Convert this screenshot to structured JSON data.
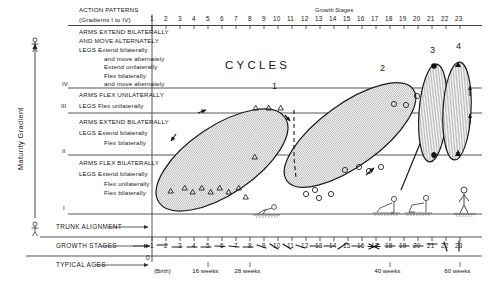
{
  "figure": {
    "title": "CYCLES",
    "y_axis_label": "Maturity Gradient",
    "x_axis_title": "Growth Stages",
    "column_header_line1": "ACTION PATTERNS",
    "column_header_line2": "(Gradients I to IV)",
    "origin_label": "0"
  },
  "gradients": [
    {
      "roman": "IV",
      "lines": [
        "ARMS EXTEND BILATERALLY",
        "AND MOVE ALTERNATELY",
        "LEGS Extend bilaterally",
        "and move alternately",
        "Extend unilaterally",
        "Flex bilaterally",
        "and move alternately"
      ]
    },
    {
      "roman": "III",
      "lines": [
        "ARMS FLEX UNILATERALLY",
        "LEGS Flex unilaterally"
      ]
    },
    {
      "roman": "II",
      "lines": [
        "ARMS EXTEND BILATERALLY",
        "LEGS Extend bilaterally",
        "Flex bilaterally"
      ]
    },
    {
      "roman": "I",
      "lines": [
        "ARMS FLEX BILATERALLY",
        "LEGS Extend bilaterally",
        "Flex unilaterally",
        "Flex bilaterally"
      ]
    }
  ],
  "bottom_rows": [
    {
      "label": "TRUNK ALIGNMENT"
    },
    {
      "label": "GROWTH STAGES"
    },
    {
      "label": "TYPICAL AGES"
    }
  ],
  "chart_data": {
    "type": "scatter",
    "title": "CYCLES",
    "xlabel": "Growth Stages",
    "ylabel": "Maturity Gradient",
    "xlim": [
      0,
      23.8
    ],
    "ylim": [
      0,
      4
    ],
    "grid": false,
    "legend": "none",
    "x_ticks": [
      1,
      2,
      3,
      4,
      5,
      6,
      7,
      8,
      9,
      10,
      11,
      12,
      13,
      14,
      15,
      16,
      17,
      18,
      19,
      20,
      21,
      22,
      23
    ],
    "x_tick_labels": [
      "1",
      "2",
      "3",
      "4",
      "5",
      "6",
      "7",
      "8",
      "9",
      "10",
      "11",
      "12",
      "13",
      "14",
      "15",
      "16",
      "17",
      "18",
      "19",
      "20",
      "21",
      "22",
      "23"
    ],
    "age_ticks": [
      {
        "stage": 1,
        "label": "(Birth)"
      },
      {
        "stage": 5,
        "label": "16 weeks"
      },
      {
        "stage": 8,
        "label": "28 weeks"
      },
      {
        "stage": 18,
        "label": "40 weeks"
      },
      {
        "stage": 23,
        "label": "60 weeks"
      }
    ],
    "gradient_bands": [
      "I",
      "II",
      "III",
      "IV"
    ],
    "cycles": [
      {
        "name": "1",
        "label_x": 10.4,
        "marker": "open-triangle",
        "points": [
          [
            1.15,
            0.45
          ],
          [
            2.1,
            0.42
          ],
          [
            2.65,
            0.3
          ],
          [
            3.3,
            0.45
          ],
          [
            3.9,
            0.3
          ],
          [
            4.55,
            0.46
          ],
          [
            5.2,
            0.3
          ],
          [
            5.9,
            0.45
          ],
          [
            6.4,
            0.18
          ],
          [
            7.0,
            1.15
          ],
          [
            9.3,
            2.35
          ],
          [
            10.2,
            2.35
          ],
          [
            11.0,
            2.35
          ]
        ]
      },
      {
        "name": "2",
        "label_x": 16.6,
        "marker": "open-circle",
        "points": [
          [
            11.1,
            0.52
          ],
          [
            11.7,
            0.63
          ],
          [
            12.0,
            0.4
          ],
          [
            12.9,
            0.52
          ],
          [
            13.9,
            1.22
          ],
          [
            14.9,
            1.3
          ],
          [
            15.6,
            1.18
          ],
          [
            16.5,
            1.3
          ],
          [
            17.5,
            2.38
          ],
          [
            18.4,
            2.35
          ],
          [
            19.2,
            2.62
          ]
        ]
      },
      {
        "name": "3",
        "label_x": 20.6,
        "marker": "filled-circle",
        "points": [
          [
            20.9,
            2.95
          ],
          [
            20.8,
            0.72
          ]
        ]
      },
      {
        "name": "4",
        "label_x": 22.2,
        "marker": "filled-triangle",
        "points": [
          [
            22.3,
            2.95
          ],
          [
            22.2,
            0.72
          ]
        ]
      }
    ]
  }
}
